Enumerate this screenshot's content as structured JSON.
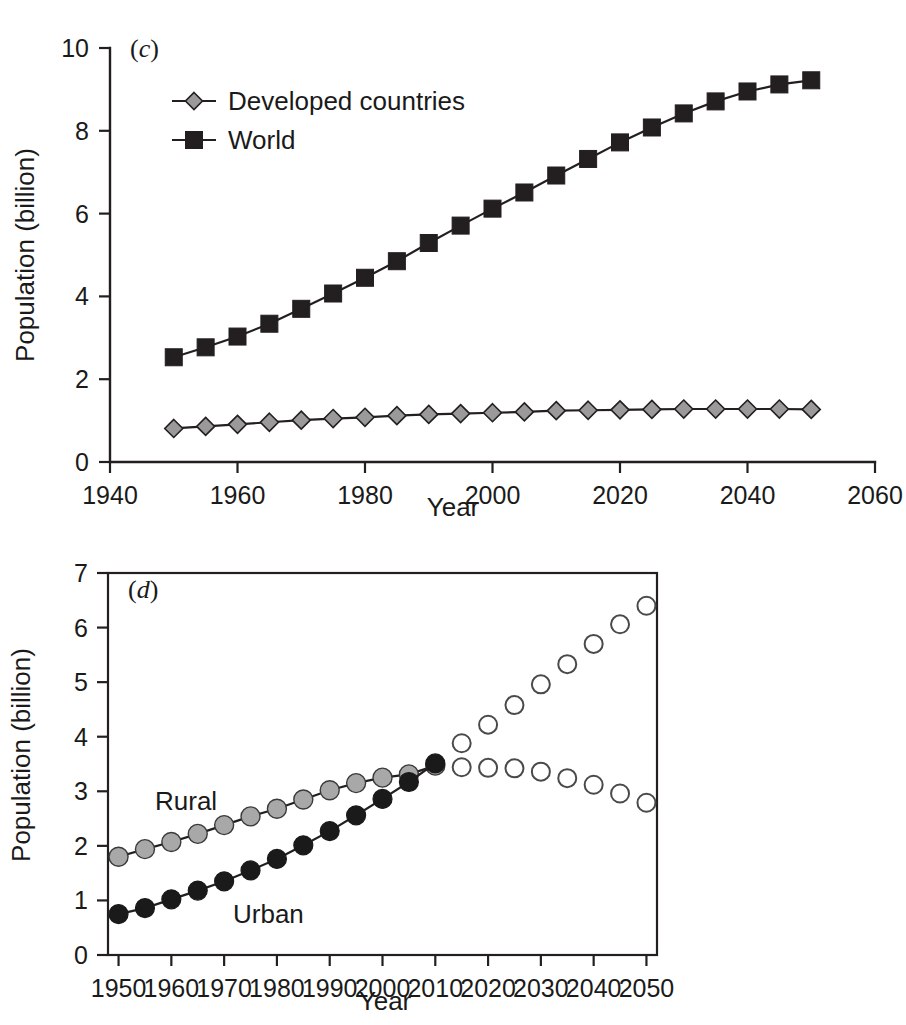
{
  "figure": {
    "panels": [
      "c",
      "d"
    ]
  },
  "panel_c": {
    "label": "(c)",
    "label_paren_open": "(",
    "label_letter": "c",
    "label_paren_close": ")",
    "xlabel": "Year",
    "ylabel": "Population (billion)",
    "legend": [
      {
        "name": "Developed countries",
        "marker": "diamond-gray"
      },
      {
        "name": "World",
        "marker": "square-black"
      }
    ],
    "xticks": [
      "1940",
      "1960",
      "1980",
      "2000",
      "2020",
      "2040",
      "2060"
    ],
    "yticks": [
      "0",
      "2",
      "4",
      "6",
      "8",
      "10"
    ]
  },
  "panel_d": {
    "label": "(d)",
    "label_paren_open": "(",
    "label_letter": "d",
    "label_paren_close": ")",
    "xlabel": "Year",
    "ylabel": "Population (billion)",
    "inline_labels": [
      {
        "text": "Rural"
      },
      {
        "text": "Urban"
      }
    ],
    "xticks": [
      "1950",
      "1960",
      "1970",
      "1980",
      "1990",
      "2000",
      "2010",
      "2020",
      "2030",
      "2040",
      "2050"
    ],
    "yticks": [
      "0",
      "1",
      "2",
      "3",
      "4",
      "5",
      "6",
      "7"
    ]
  },
  "colors": {
    "axis": "#231f20",
    "world_marker": "#231f20",
    "developed_marker": "#9a9a9a",
    "rural_marker": "#a8a8a8",
    "urban_marker": "#1a1a1a",
    "projection_marker": "#ffffff",
    "projection_stroke": "#4a4a4a"
  },
  "chart_data": [
    {
      "type": "line",
      "panel": "c",
      "title": "(c)",
      "xlabel": "Year",
      "ylabel": "Population (billion)",
      "xlim": [
        1940,
        2060
      ],
      "ylim": [
        0,
        10
      ],
      "xticks": [
        1940,
        1960,
        1980,
        2000,
        2020,
        2040,
        2060
      ],
      "yticks": [
        0,
        2,
        4,
        6,
        8,
        10
      ],
      "grid": false,
      "legend_position": "upper-left-inside",
      "x": [
        1950,
        1955,
        1960,
        1965,
        1970,
        1975,
        1980,
        1985,
        1990,
        1995,
        2000,
        2005,
        2010,
        2015,
        2020,
        2025,
        2030,
        2035,
        2040,
        2045,
        2050
      ],
      "series": [
        {
          "name": "World",
          "marker": "square",
          "color": "#231f20",
          "values": [
            2.53,
            2.77,
            3.03,
            3.34,
            3.7,
            4.07,
            4.45,
            4.85,
            5.29,
            5.71,
            6.12,
            6.51,
            6.92,
            7.32,
            7.72,
            8.08,
            8.42,
            8.71,
            8.95,
            9.12,
            9.22
          ]
        },
        {
          "name": "Developed countries",
          "marker": "diamond",
          "color": "#9a9a9a",
          "values": [
            0.81,
            0.86,
            0.91,
            0.96,
            1.01,
            1.05,
            1.08,
            1.12,
            1.15,
            1.17,
            1.19,
            1.21,
            1.24,
            1.25,
            1.26,
            1.27,
            1.28,
            1.28,
            1.28,
            1.28,
            1.27
          ]
        }
      ]
    },
    {
      "type": "scatter",
      "panel": "d",
      "title": "(d)",
      "xlabel": "Year",
      "ylabel": "Population (billion)",
      "xlim": [
        1948,
        2052
      ],
      "ylim": [
        0,
        7
      ],
      "xticks": [
        1950,
        1960,
        1970,
        1980,
        1990,
        2000,
        2010,
        2020,
        2030,
        2040,
        2050
      ],
      "yticks": [
        0,
        1,
        2,
        3,
        4,
        5,
        6,
        7
      ],
      "grid": false,
      "legend_position": "inline-annotations",
      "x": [
        1950,
        1955,
        1960,
        1965,
        1970,
        1975,
        1980,
        1985,
        1990,
        1995,
        2000,
        2005,
        2010,
        2015,
        2020,
        2025,
        2030,
        2035,
        2040,
        2045,
        2050
      ],
      "series": [
        {
          "name": "Rural",
          "marker": "filled-circle-gray",
          "color": "#a8a8a8",
          "connected_through": 2010,
          "values": [
            1.8,
            1.94,
            2.07,
            2.22,
            2.38,
            2.54,
            2.68,
            2.85,
            3.02,
            3.15,
            3.25,
            3.31,
            3.47,
            3.44,
            3.43,
            3.42,
            3.36,
            3.24,
            3.12,
            2.96,
            2.79
          ]
        },
        {
          "name": "Urban",
          "marker": "filled-circle-black",
          "color": "#1a1a1a",
          "connected_through": 2010,
          "values": [
            0.75,
            0.86,
            1.02,
            1.18,
            1.35,
            1.55,
            1.76,
            2.01,
            2.27,
            2.56,
            2.86,
            3.17,
            3.51,
            3.88,
            4.22,
            4.58,
            4.96,
            5.33,
            5.7,
            6.06,
            6.4
          ]
        }
      ],
      "notes": "Points from 1950 to 2010 are filled and joined by a line (observed); points from 2015 to 2050 are unfilled open circles with no connecting line (projected)."
    }
  ]
}
